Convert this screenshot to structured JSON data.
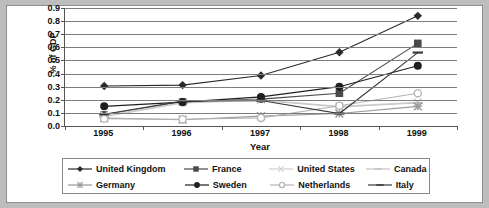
{
  "chart_data": {
    "type": "line",
    "title": "",
    "xlabel": "Year",
    "ylabel": "% of GDP",
    "categories": [
      "1995",
      "1996",
      "1997",
      "1998",
      "1999"
    ],
    "x": [
      1995,
      1996,
      1997,
      1998,
      1999
    ],
    "ylim": [
      0.0,
      0.9
    ],
    "ytick_labels": [
      "0.0",
      "0.1",
      "0.2",
      "0.3",
      "0.4",
      "0.5",
      "0.6",
      "0.7",
      "0.8",
      "0.9"
    ],
    "ytick_values": [
      0.0,
      0.1,
      0.2,
      0.3,
      0.4,
      0.5,
      0.6,
      0.7,
      0.8,
      0.9
    ],
    "grid": true,
    "legend_position": "bottom",
    "series": [
      {
        "name": "United Kingdom",
        "marker": "diamond",
        "color": "#2b2b2b",
        "values": [
          0.305,
          0.312,
          0.385,
          0.562,
          0.84
        ]
      },
      {
        "name": "France",
        "marker": "square",
        "color": "#4a4a4a",
        "values": [
          0.085,
          0.185,
          0.205,
          0.25,
          0.63
        ]
      },
      {
        "name": "United States",
        "marker": "cross",
        "color": "#cfcfcf",
        "values": [
          0.082,
          0.18,
          0.2,
          0.15,
          0.18
        ]
      },
      {
        "name": "Canada",
        "marker": "dash",
        "color": "#c4c4c4",
        "values": [
          0.07,
          0.175,
          0.195,
          0.145,
          0.175
        ]
      },
      {
        "name": "Germany",
        "marker": "star",
        "color": "#9a9a9a",
        "values": [
          0.06,
          0.048,
          0.075,
          0.095,
          0.15
        ]
      },
      {
        "name": "Sweden",
        "marker": "circle",
        "color": "#1f1f1f",
        "values": [
          0.15,
          0.182,
          0.222,
          0.3,
          0.46
        ]
      },
      {
        "name": "Netherlands",
        "marker": "opencircle",
        "color": "#b5b5b5",
        "values": [
          0.055,
          0.052,
          0.062,
          0.155,
          0.25
        ]
      },
      {
        "name": "Italy",
        "marker": "bar",
        "color": "#3a3a3a",
        "values": [
          0.09,
          0.19,
          0.195,
          0.095,
          0.56
        ]
      }
    ]
  },
  "legend": {
    "rows": [
      [
        "United Kingdom",
        "France",
        "United States",
        "Canada"
      ],
      [
        "Germany",
        "Sweden",
        "Netherlands",
        "Italy"
      ]
    ]
  }
}
